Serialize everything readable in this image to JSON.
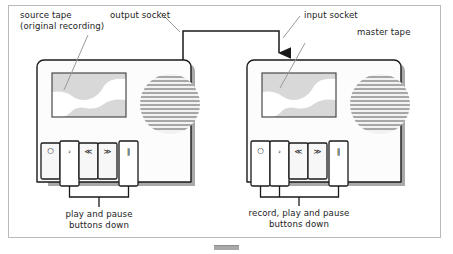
{
  "diagram": {
    "frame": {
      "border_color": "#b9b9b9",
      "background": "#ffffff"
    }
  },
  "labels": {
    "source_tape_line1": "source tape",
    "source_tape_line2": "(original recording)",
    "output_socket": "output socket",
    "input_socket": "input socket",
    "master_tape": "master tape",
    "left_caption_line1": "play and pause",
    "left_caption_line2": "buttons down",
    "right_caption_line1": "record, play and pause",
    "right_caption_line2": "buttons down"
  },
  "units": [
    {
      "id": "source-deck",
      "name": "source tape deck",
      "buttons": [
        {
          "name": "record-button",
          "glyph": "○",
          "pressed": false
        },
        {
          "name": "play-button",
          "glyph": "›",
          "pressed": true
        },
        {
          "name": "rewind-button",
          "glyph": "≪",
          "pressed": false
        },
        {
          "name": "fast-forward-button",
          "glyph": "≫",
          "pressed": false
        },
        {
          "name": "pause-button",
          "glyph": "‖",
          "pressed": true
        }
      ]
    },
    {
      "id": "master-deck",
      "name": "master tape deck",
      "buttons": [
        {
          "name": "record-button",
          "glyph": "○",
          "pressed": true
        },
        {
          "name": "play-button",
          "glyph": "›",
          "pressed": true
        },
        {
          "name": "rewind-button",
          "glyph": "≪",
          "pressed": false
        },
        {
          "name": "fast-forward-button",
          "glyph": "≫",
          "pressed": false
        },
        {
          "name": "pause-button",
          "glyph": "‖",
          "pressed": true
        }
      ]
    }
  ],
  "colors": {
    "body_fill": "#fcfcfc",
    "body_stroke": "#1a1a1a",
    "shadow": "#9a9a9a",
    "screen_fill": "#ffffff",
    "screen_band": "#d8d8d8",
    "speaker_stripe": "#8e8e8e",
    "leader_line": "#9a9a9a",
    "cable": "#1a1a1a",
    "button_fill": "#f7f7f7",
    "text": "#232323"
  },
  "cable": {
    "from": "output socket (source deck top)",
    "to": "input socket (master deck top)",
    "has_arrowhead": true
  }
}
